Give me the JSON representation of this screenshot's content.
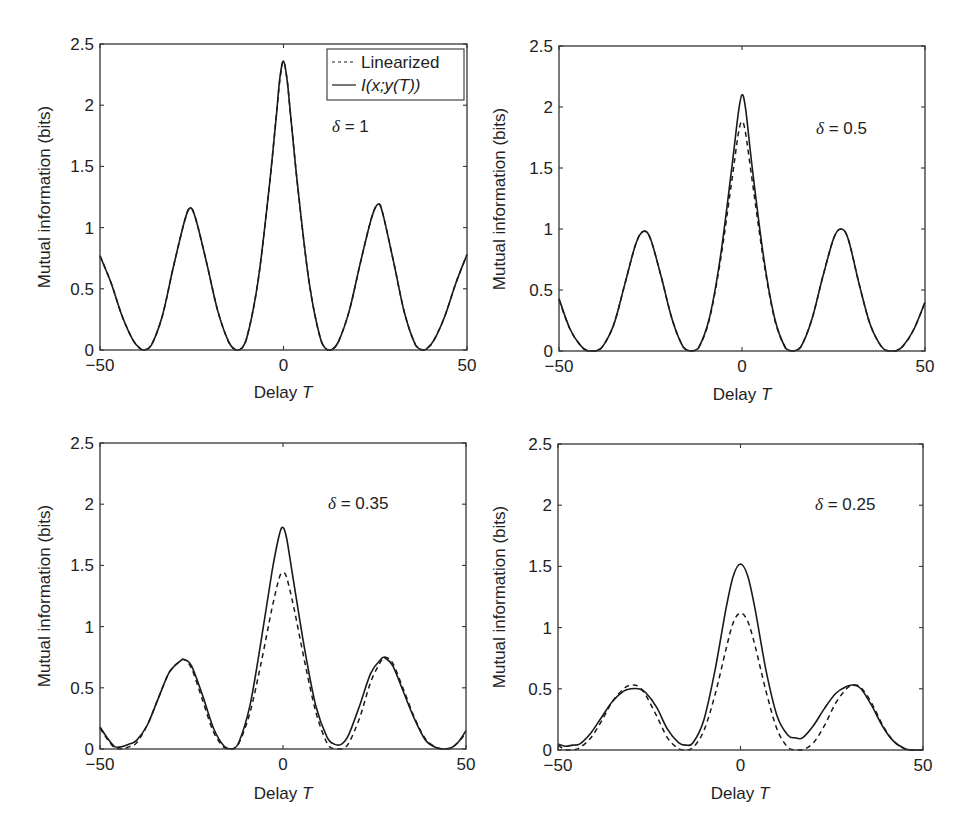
{
  "figure": {
    "legend": {
      "entries": [
        {
          "label": "Linearized",
          "style": "dashed"
        },
        {
          "label": "I(x;y(T))",
          "style": "solid"
        }
      ]
    }
  },
  "chart_data": [
    {
      "type": "line",
      "title": "",
      "annotation": "δ = 1",
      "xlabel": "Delay T",
      "ylabel": "Mutual information (bits)",
      "xlim": [
        -50,
        50
      ],
      "ylim": [
        0,
        2.5
      ],
      "xticks": [
        -50,
        0,
        50
      ],
      "yticks": [
        0,
        0.5,
        1,
        1.5,
        2,
        2.5
      ],
      "xtick_labels": [
        "−50",
        "0",
        "50"
      ],
      "ytick_labels": [
        "0",
        "0.5",
        "1",
        "1.5",
        "2",
        "2.5"
      ],
      "grid": false,
      "legend_position": "upper right",
      "series": [
        {
          "name": "Linearized",
          "style": "dashed",
          "x": [
            -50,
            -47,
            -44,
            -41,
            -39,
            -38,
            -36,
            -33,
            -30,
            -27,
            -25.5,
            -24,
            -21,
            -18,
            -15,
            -13,
            -12,
            -10,
            -7,
            -4,
            -2,
            -1,
            0,
            1,
            2,
            4,
            7,
            10,
            12,
            13,
            15,
            18,
            21,
            24,
            25.7,
            27,
            30,
            33,
            36,
            38,
            39,
            41,
            44,
            47,
            50
          ],
          "y": [
            0.77,
            0.55,
            0.28,
            0.08,
            0.01,
            0.0,
            0.04,
            0.28,
            0.68,
            1.05,
            1.16,
            1.08,
            0.72,
            0.33,
            0.07,
            0.0,
            0.0,
            0.1,
            0.55,
            1.3,
            1.9,
            2.2,
            2.36,
            2.2,
            1.9,
            1.3,
            0.55,
            0.1,
            0.0,
            0.0,
            0.07,
            0.33,
            0.72,
            1.08,
            1.19,
            1.12,
            0.72,
            0.3,
            0.04,
            0.0,
            0.01,
            0.08,
            0.28,
            0.55,
            0.78
          ]
        },
        {
          "name": "I(x;y(T))",
          "style": "solid",
          "x": [
            -50,
            -47,
            -44,
            -41,
            -39,
            -38,
            -36,
            -33,
            -30,
            -27,
            -25.5,
            -24,
            -21,
            -18,
            -15,
            -13,
            -12,
            -10,
            -7,
            -4,
            -2,
            -1,
            0,
            1,
            2,
            4,
            7,
            10,
            12,
            13,
            15,
            18,
            21,
            24,
            25.7,
            27,
            30,
            33,
            36,
            38,
            39,
            41,
            44,
            47,
            50
          ],
          "y": [
            0.77,
            0.55,
            0.28,
            0.08,
            0.01,
            0.0,
            0.04,
            0.28,
            0.68,
            1.05,
            1.16,
            1.08,
            0.72,
            0.33,
            0.07,
            0.0,
            0.0,
            0.1,
            0.55,
            1.3,
            1.9,
            2.22,
            2.36,
            2.2,
            1.9,
            1.3,
            0.55,
            0.1,
            0.0,
            0.0,
            0.07,
            0.33,
            0.72,
            1.08,
            1.19,
            1.12,
            0.72,
            0.3,
            0.04,
            0.0,
            0.01,
            0.08,
            0.28,
            0.55,
            0.78
          ]
        }
      ]
    },
    {
      "type": "line",
      "title": "",
      "annotation": "δ = 0.5",
      "xlabel": "Delay T",
      "ylabel": "Mutual information (bits)",
      "xlim": [
        -50,
        50
      ],
      "ylim": [
        0,
        2.5
      ],
      "xticks": [
        -50,
        0,
        50
      ],
      "yticks": [
        0,
        0.5,
        1,
        1.5,
        2,
        2.5
      ],
      "xtick_labels": [
        "−50",
        "0",
        "50"
      ],
      "ytick_labels": [
        "0",
        "0.5",
        "1",
        "1.5",
        "2",
        "2.5"
      ],
      "grid": false,
      "series": [
        {
          "name": "Linearized",
          "style": "dashed",
          "x": [
            -50,
            -47,
            -44,
            -42,
            -40,
            -38,
            -35,
            -32,
            -29,
            -27,
            -25,
            -22,
            -19,
            -16,
            -14,
            -12,
            -9,
            -6,
            -3,
            -1,
            0,
            1,
            3,
            6,
            9,
            12,
            14,
            16,
            19,
            22,
            25,
            27,
            29,
            32,
            35,
            38,
            40,
            42,
            44,
            47,
            50
          ],
          "y": [
            0.42,
            0.18,
            0.04,
            0.0,
            0.0,
            0.04,
            0.22,
            0.55,
            0.88,
            0.98,
            0.92,
            0.6,
            0.25,
            0.03,
            0.0,
            0.02,
            0.25,
            0.72,
            1.35,
            1.78,
            1.88,
            1.78,
            1.35,
            0.72,
            0.25,
            0.02,
            0.0,
            0.03,
            0.25,
            0.6,
            0.92,
            1.0,
            0.92,
            0.55,
            0.22,
            0.04,
            0.0,
            0.0,
            0.04,
            0.18,
            0.4
          ]
        },
        {
          "name": "I(x;y(T))",
          "style": "solid",
          "x": [
            -50,
            -47,
            -44,
            -42,
            -40,
            -38,
            -35,
            -32,
            -29,
            -27,
            -25,
            -22,
            -19,
            -16,
            -14,
            -12,
            -9,
            -6,
            -3,
            -1,
            0,
            1,
            3,
            6,
            9,
            12,
            14,
            16,
            19,
            22,
            25,
            27,
            29,
            32,
            35,
            38,
            40,
            42,
            44,
            47,
            50
          ],
          "y": [
            0.43,
            0.18,
            0.04,
            0.0,
            0.0,
            0.04,
            0.22,
            0.55,
            0.88,
            0.98,
            0.92,
            0.6,
            0.25,
            0.03,
            0.0,
            0.02,
            0.26,
            0.75,
            1.45,
            1.95,
            2.1,
            1.98,
            1.45,
            0.75,
            0.26,
            0.02,
            0.0,
            0.03,
            0.25,
            0.6,
            0.92,
            1.0,
            0.92,
            0.55,
            0.22,
            0.04,
            0.0,
            0.0,
            0.04,
            0.18,
            0.4
          ]
        }
      ]
    },
    {
      "type": "line",
      "title": "",
      "annotation": "δ = 0.35",
      "xlabel": "Delay T",
      "ylabel": "Mutual information (bits)",
      "xlim": [
        -50,
        50
      ],
      "ylim": [
        0,
        2.5
      ],
      "xticks": [
        -50,
        0,
        50
      ],
      "yticks": [
        0,
        0.5,
        1,
        1.5,
        2,
        2.5
      ],
      "xtick_labels": [
        "−50",
        "0",
        "50"
      ],
      "ytick_labels": [
        "0",
        "0.5",
        "1",
        "1.5",
        "2",
        "2.5"
      ],
      "grid": false,
      "series": [
        {
          "name": "Linearized",
          "style": "dashed",
          "x": [
            -50,
            -48,
            -46,
            -44,
            -42,
            -40,
            -37,
            -34,
            -31,
            -28,
            -27,
            -25,
            -22,
            -19,
            -16,
            -14,
            -12,
            -9,
            -6,
            -3,
            -1,
            0,
            1,
            3,
            6,
            9,
            12,
            14,
            16,
            18,
            21,
            24,
            27,
            28,
            30,
            33,
            36,
            39,
            42,
            44,
            46,
            48,
            50
          ],
          "y": [
            0.17,
            0.08,
            0.01,
            0.0,
            0.02,
            0.05,
            0.2,
            0.42,
            0.63,
            0.72,
            0.73,
            0.66,
            0.4,
            0.14,
            0.01,
            0.0,
            0.05,
            0.3,
            0.7,
            1.15,
            1.4,
            1.44,
            1.4,
            1.15,
            0.7,
            0.3,
            0.05,
            0.0,
            0.0,
            0.05,
            0.26,
            0.55,
            0.73,
            0.75,
            0.7,
            0.48,
            0.25,
            0.08,
            0.01,
            0.0,
            0.01,
            0.06,
            0.13
          ]
        },
        {
          "name": "I(x;y(T))",
          "style": "solid",
          "x": [
            -50,
            -48,
            -46,
            -44,
            -42,
            -40,
            -37,
            -34,
            -31,
            -28,
            -27,
            -25,
            -22,
            -19,
            -16,
            -14,
            -12,
            -9,
            -6,
            -3,
            -1,
            0,
            1,
            3,
            6,
            9,
            12,
            14,
            16,
            18,
            21,
            24,
            27,
            28,
            30,
            33,
            36,
            39,
            42,
            44,
            46,
            48,
            50
          ],
          "y": [
            0.18,
            0.09,
            0.02,
            0.02,
            0.04,
            0.07,
            0.2,
            0.42,
            0.63,
            0.72,
            0.73,
            0.68,
            0.44,
            0.17,
            0.02,
            0.0,
            0.06,
            0.36,
            0.88,
            1.45,
            1.75,
            1.81,
            1.72,
            1.35,
            0.8,
            0.35,
            0.1,
            0.04,
            0.04,
            0.12,
            0.36,
            0.62,
            0.74,
            0.74,
            0.68,
            0.46,
            0.24,
            0.07,
            0.01,
            0.0,
            0.01,
            0.06,
            0.15
          ]
        }
      ]
    },
    {
      "type": "line",
      "title": "",
      "annotation": "δ = 0.25",
      "xlabel": "Delay T",
      "ylabel": "Mutual information (bits)",
      "xlim": [
        -50,
        50
      ],
      "ylim": [
        0,
        2.5
      ],
      "xticks": [
        -50,
        0,
        50
      ],
      "yticks": [
        0,
        0.5,
        1,
        1.5,
        2,
        2.5
      ],
      "xtick_labels": [
        "−50",
        "0",
        "50"
      ],
      "ytick_labels": [
        "0",
        "0.5",
        "1",
        "1.5",
        "2",
        "2.5"
      ],
      "grid": false,
      "series": [
        {
          "name": "Linearized",
          "style": "dashed",
          "x": [
            -50,
            -48,
            -46,
            -44,
            -41,
            -38,
            -35,
            -32,
            -30,
            -28,
            -26,
            -23,
            -20,
            -17,
            -15,
            -13,
            -10,
            -7,
            -4,
            -2,
            0,
            2,
            4,
            7,
            10,
            13,
            15,
            17,
            20,
            23,
            26,
            29,
            31,
            33,
            36,
            39,
            42,
            45,
            47,
            50
          ],
          "y": [
            0.04,
            0.0,
            0.0,
            0.02,
            0.1,
            0.24,
            0.4,
            0.5,
            0.53,
            0.52,
            0.45,
            0.28,
            0.1,
            0.01,
            0.0,
            0.02,
            0.16,
            0.45,
            0.82,
            1.04,
            1.12,
            1.05,
            0.85,
            0.48,
            0.17,
            0.02,
            0.0,
            0.0,
            0.06,
            0.2,
            0.38,
            0.5,
            0.53,
            0.51,
            0.38,
            0.2,
            0.07,
            0.01,
            0.0,
            0.0
          ]
        },
        {
          "name": "I(x;y(T))",
          "style": "solid",
          "x": [
            -50,
            -48,
            -46,
            -44,
            -41,
            -38,
            -35,
            -32,
            -30,
            -28,
            -26,
            -23,
            -20,
            -17,
            -15,
            -13,
            -10,
            -7,
            -4,
            -2,
            0,
            2,
            4,
            7,
            10,
            13,
            15,
            17,
            20,
            23,
            26,
            29,
            31,
            33,
            36,
            39,
            42,
            45,
            47,
            50
          ],
          "y": [
            0.05,
            0.03,
            0.04,
            0.05,
            0.14,
            0.27,
            0.4,
            0.48,
            0.5,
            0.5,
            0.47,
            0.35,
            0.17,
            0.06,
            0.04,
            0.06,
            0.25,
            0.65,
            1.15,
            1.42,
            1.52,
            1.42,
            1.15,
            0.65,
            0.28,
            0.12,
            0.1,
            0.1,
            0.2,
            0.34,
            0.46,
            0.52,
            0.53,
            0.5,
            0.36,
            0.19,
            0.07,
            0.01,
            0.0,
            0.0
          ]
        }
      ]
    }
  ]
}
